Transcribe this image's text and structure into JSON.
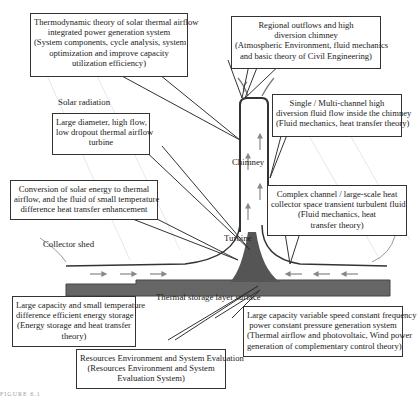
{
  "labels": {
    "solar_radiation": "Solar radiation",
    "chimney": "Chimney",
    "turbine": "Turbine",
    "collector_shed": "Collector shed",
    "thermal_storage": "Thermal storage layer surface",
    "figure": "FIGURE 6.1"
  },
  "boxes": {
    "thermo": [
      "Thermodynamic theory of solar thermal airflow",
      "integrated power generation system",
      "(System components, cycle analysis, system",
      "optimization and improve capacity",
      "utilization efficiency)"
    ],
    "regional": [
      "Regional outflows and high",
      "diversion chimney",
      "(Atmospheric Environment, fluid mechanics",
      "and basic theory of Civil Engineering)"
    ],
    "single": [
      "Single / Multi-channel high",
      "diversion fluid flow inside the chimney",
      "(Fluid mechanics, heat transfer theory)"
    ],
    "turbine_box": [
      "Large diameter, high flow,",
      "low dropout thermal airflow",
      "turbine"
    ],
    "conversion": [
      "Conversion of solar energy to thermal",
      "airflow, and the fluid of small temperature",
      "difference heat transfer enhancement"
    ],
    "complex": [
      "Complex channel / large-scale heat",
      "collector space transient turbulent fluid",
      "(Fluid mechanics, heat",
      "transfer theory)"
    ],
    "storage": [
      "Large capacity and small temperature",
      "difference efficient energy storage",
      "(Energy storage and heat transfer",
      "theory)"
    ],
    "variable": [
      "Large capacity variable speed constant frequency",
      "power constant pressure generation system",
      "(Thermal airflow and photovoltaic, Wind power",
      "generation of complementary control theory)"
    ],
    "resources": [
      "Resources Environment and System Evaluation",
      "(Resources  Environment and System",
      "Evaluation System)"
    ]
  }
}
